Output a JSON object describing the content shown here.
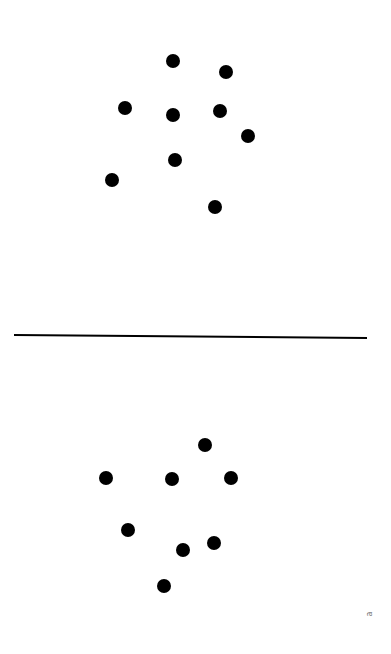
{
  "figure": {
    "dot_color": "#000000",
    "line_color": "#000000",
    "top_panel": {
      "dot_count": 9,
      "dots": [
        {
          "x": 173,
          "y": 61
        },
        {
          "x": 226,
          "y": 72
        },
        {
          "x": 125,
          "y": 108
        },
        {
          "x": 173,
          "y": 115
        },
        {
          "x": 220,
          "y": 111
        },
        {
          "x": 248,
          "y": 136
        },
        {
          "x": 175,
          "y": 160
        },
        {
          "x": 112,
          "y": 180
        },
        {
          "x": 215,
          "y": 207
        }
      ]
    },
    "divider": {
      "x1": 14,
      "y1": 335,
      "x2": 367,
      "y2": 338
    },
    "bottom_panel": {
      "dot_count": 8,
      "dots": [
        {
          "x": 205,
          "y": 445
        },
        {
          "x": 106,
          "y": 478
        },
        {
          "x": 172,
          "y": 479
        },
        {
          "x": 231,
          "y": 478
        },
        {
          "x": 128,
          "y": 530
        },
        {
          "x": 183,
          "y": 550
        },
        {
          "x": 214,
          "y": 543
        },
        {
          "x": 164,
          "y": 586
        }
      ]
    },
    "corner_label": {
      "text": "a",
      "x": 369,
      "y": 614
    }
  }
}
